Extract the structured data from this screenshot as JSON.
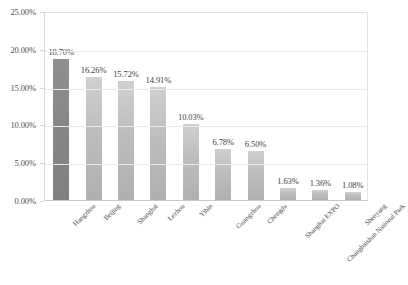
{
  "chart_data": {
    "type": "bar",
    "title": "",
    "xlabel": "",
    "ylabel": "",
    "ylim": [
      0,
      25
    ],
    "ytick_labels": [
      "25.00%",
      "20.00%",
      "15.00%",
      "10.00%",
      "5.00%",
      "0.00%"
    ],
    "ytick_values": [
      25,
      20,
      15,
      10,
      5,
      0
    ],
    "grid": true,
    "legend": "none",
    "categories": [
      "Hangzhou",
      "Beijing",
      "Shanghai",
      "Lezhou",
      "Yibin",
      "Guangzhou",
      "Chengdu",
      "Shanghai EXPO",
      "Changbaishan National Park",
      "Shenyang"
    ],
    "values": [
      18.7,
      16.26,
      15.72,
      14.91,
      10.03,
      6.78,
      6.5,
      1.63,
      1.36,
      1.08
    ],
    "value_labels": [
      "18.70%",
      "16.26%",
      "15.72%",
      "14.91%",
      "10.03%",
      "6.78%",
      "6.50%",
      "1.63%",
      "1.36%",
      "1.08%"
    ],
    "bar_styles": [
      "dark",
      "light",
      "light",
      "light",
      "light",
      "light",
      "light",
      "light",
      "light",
      "light"
    ]
  },
  "colors": {
    "background": "#ffffff",
    "bar_light_top": "#d0d0d0",
    "bar_light_bottom": "#b0b0b0",
    "bar_dark_top": "#8f8f8f",
    "bar_dark_bottom": "#808080",
    "gridline": "#eceaea",
    "axis": "#c9c9c9",
    "text": "#404040"
  }
}
